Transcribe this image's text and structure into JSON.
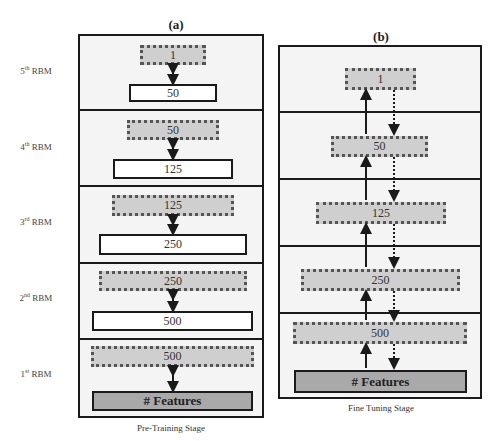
{
  "panel_a": {
    "title": "(a)",
    "caption": "Pre-Training Stage",
    "rbm_labels": [
      {
        "num": "5",
        "sup": "th",
        "text": "RBM"
      },
      {
        "num": "4",
        "sup": "th",
        "text": "RBM"
      },
      {
        "num": "3",
        "sup": "rd",
        "text": "RBM"
      },
      {
        "num": "2",
        "sup": "nd",
        "text": "RBM"
      },
      {
        "num": "1",
        "sup": "st",
        "text": "RBM"
      }
    ],
    "sections": [
      {
        "hidden": "1",
        "visible": "50"
      },
      {
        "hidden": "50",
        "visible": "125"
      },
      {
        "hidden": "125",
        "visible": "250"
      },
      {
        "hidden": "250",
        "visible": "500"
      },
      {
        "hidden": "500",
        "visible": "# Features"
      }
    ]
  },
  "panel_b": {
    "title": "(b)",
    "caption": "Fine Tuning Stage",
    "layers": [
      "1",
      "50",
      "125",
      "250",
      "500",
      "# Features"
    ]
  },
  "colors": {
    "border": "#1a1a1a",
    "hidden_fill": "#cfcfcf",
    "input_fill": "#a9a9a9",
    "panel_bg": "#f4f4f4"
  }
}
